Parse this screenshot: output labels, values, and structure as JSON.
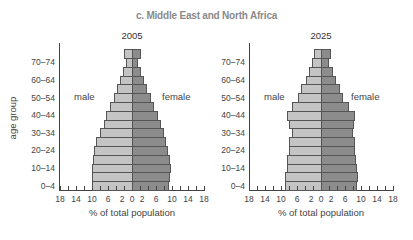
{
  "title": "c. Middle East and North Africa",
  "y_axis_title": "age group",
  "x_axis_title": "% of total population",
  "sex_labels": {
    "male": "male",
    "female": "female"
  },
  "age_tick_labels": [
    "0–4",
    "10–14",
    "20–24",
    "30–34",
    "40–44",
    "50–54",
    "60–64",
    "70–74"
  ],
  "x_tick_labels": [
    "18",
    "14",
    "10",
    "6",
    "2",
    "0",
    "2",
    "6",
    "10",
    "14",
    "18"
  ],
  "colors": {
    "male": "#c4c4c4",
    "female": "#8c8c8c",
    "outline": "#555555",
    "title": "#8a8a8a"
  },
  "chart_data": [
    {
      "type": "bar",
      "subtype": "population_pyramid",
      "title": "2005",
      "xlabel": "% of total population",
      "ylabel": "age group",
      "xlim": [
        -18,
        18
      ],
      "categories": [
        "0-4",
        "5-9",
        "10-14",
        "15-19",
        "20-24",
        "25-29",
        "30-34",
        "35-39",
        "40-44",
        "45-49",
        "50-54",
        "55-59",
        "60-64",
        "65-69",
        "70-74",
        "75+"
      ],
      "series": [
        {
          "name": "male",
          "values": [
            10.0,
            10.0,
            10.0,
            9.8,
            9.5,
            9.0,
            8.0,
            7.0,
            6.5,
            5.5,
            4.5,
            3.8,
            3.0,
            2.2,
            1.5,
            2.0
          ]
        },
        {
          "name": "female",
          "values": [
            9.3,
            9.5,
            9.8,
            9.5,
            9.0,
            8.5,
            8.0,
            7.3,
            6.5,
            5.5,
            4.8,
            3.8,
            3.0,
            2.3,
            1.4,
            2.2
          ]
        }
      ],
      "legend": "inline labels 'male' (left) and 'female' (right)"
    },
    {
      "type": "bar",
      "subtype": "population_pyramid",
      "title": "2025",
      "xlabel": "% of total population",
      "ylabel": "age group",
      "xlim": [
        -18,
        18
      ],
      "categories": [
        "0-4",
        "5-9",
        "10-14",
        "15-19",
        "20-24",
        "25-29",
        "30-34",
        "35-39",
        "40-44",
        "45-49",
        "50-54",
        "55-59",
        "60-64",
        "65-69",
        "70-74",
        "75+"
      ],
      "series": [
        {
          "name": "male",
          "values": [
            9.0,
            9.0,
            8.5,
            8.5,
            8.0,
            8.0,
            7.3,
            8.0,
            8.5,
            7.3,
            5.8,
            5.0,
            3.8,
            3.0,
            2.2,
            1.8
          ]
        },
        {
          "name": "female",
          "values": [
            9.0,
            9.3,
            9.0,
            8.8,
            8.5,
            8.5,
            8.0,
            8.3,
            8.5,
            7.0,
            5.5,
            4.8,
            3.8,
            3.0,
            2.0,
            2.5
          ]
        }
      ],
      "legend": "inline labels 'male' (left) and 'female' (right)"
    }
  ]
}
